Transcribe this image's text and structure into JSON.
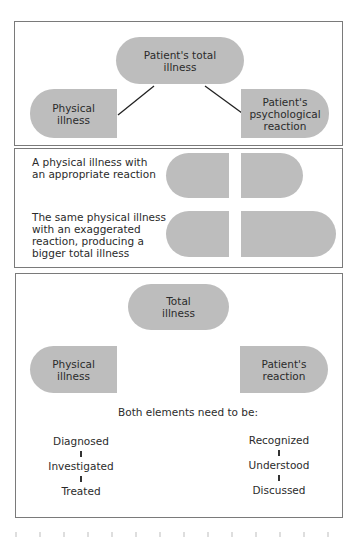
{
  "panel1": {
    "top_node": "Patient's total\nillness",
    "left_node": "Physical\nillness",
    "right_node": "Patient's\npsychological\nreaction"
  },
  "panel2": {
    "rows": [
      {
        "caption": "A physical illness with\nan appropriate reaction"
      },
      {
        "caption": "The same physical illness\nwith an exaggerated\nreaction, producing a\nbigger total illness"
      }
    ]
  },
  "panel3": {
    "top_node": "Total\nillness",
    "left_node": "Physical\nillness",
    "right_node": "Patient's\nreaction",
    "middle_text": "Both elements need to be:",
    "left_steps": [
      "Diagnosed",
      "Investigated",
      "Treated"
    ],
    "right_steps": [
      "Recognized",
      "Understood",
      "Discussed"
    ]
  },
  "colors": {
    "shape_fill": "#bdbdbd",
    "border": "#7a7a7a",
    "text": "#2b2b2b"
  }
}
